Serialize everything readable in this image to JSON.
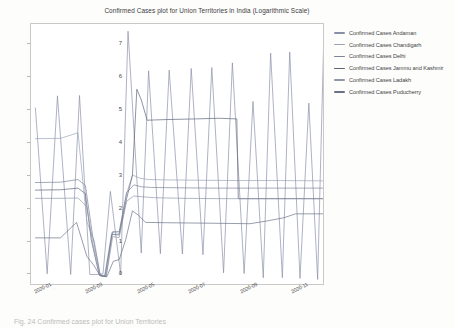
{
  "figure": {
    "caption_partial": "Fig. 24   Confirmed cases plot for Union Territories"
  },
  "chart_data": {
    "type": "line",
    "title": "Confirmed Cases plot for Union Territories in India (Logarithmic Scale)",
    "xlabel": "",
    "ylabel": "",
    "grid": false,
    "legend_position": "right",
    "ylim": [
      -0.35,
      7.6
    ],
    "yticks": [
      0,
      1,
      2,
      3,
      4,
      5,
      6,
      7
    ],
    "ytick_labels": [
      "0",
      "1",
      "2",
      "3",
      "4",
      "5",
      "6",
      "7"
    ],
    "xtick_labels": [
      "2020-01",
      "2020-03",
      "2020-05",
      "2020-07",
      "2020-09",
      "2020-11"
    ],
    "xtick_positions": [
      0.04,
      0.215,
      0.39,
      0.565,
      0.74,
      0.915
    ],
    "x_axis_type": "date",
    "note": "y values are log10 of cumulative confirmed cases; sawtooth drops are plotting artifacts of unsorted dates",
    "series": [
      {
        "name": "Confirmed Cases Andaman",
        "color": "#8a8fa8",
        "points": [
          [
            0.015,
            5.05
          ],
          [
            0.055,
            0.02
          ],
          [
            0.09,
            5.42
          ],
          [
            0.135,
            0.0
          ],
          [
            0.165,
            5.43
          ],
          [
            0.2,
            0.0
          ],
          [
            0.225,
            0.0
          ],
          [
            0.245,
            0.02
          ],
          [
            0.27,
            2.52
          ],
          [
            0.305,
            0.0
          ],
          [
            0.33,
            7.38
          ],
          [
            0.375,
            0.65
          ],
          [
            0.4,
            6.18
          ],
          [
            0.44,
            0.63
          ],
          [
            0.47,
            6.2
          ],
          [
            0.515,
            0.62
          ],
          [
            0.545,
            6.25
          ],
          [
            0.585,
            0.6
          ],
          [
            0.615,
            6.28
          ],
          [
            0.655,
            0.05
          ],
          [
            0.685,
            6.42
          ],
          [
            0.725,
            0.03
          ],
          [
            0.755,
            5.25
          ],
          [
            0.79,
            -0.1
          ],
          [
            0.815,
            6.72
          ],
          [
            0.855,
            -0.1
          ],
          [
            0.88,
            6.75
          ],
          [
            0.915,
            -0.12
          ],
          [
            0.945,
            5.2
          ],
          [
            0.975,
            -0.15
          ],
          [
            0.995,
            6.86
          ]
        ]
      },
      {
        "name": "Confirmed Cases Chandigarh",
        "color": "#9aa3ba",
        "points": [
          [
            0.015,
            4.12
          ],
          [
            0.1,
            4.13
          ],
          [
            0.16,
            4.3
          ],
          [
            0.19,
            1.6
          ],
          [
            0.215,
            1.02
          ],
          [
            0.235,
            0.0
          ],
          [
            0.25,
            -0.05
          ],
          [
            0.275,
            1.28
          ],
          [
            0.3,
            1.25
          ],
          [
            0.325,
            2.45
          ],
          [
            0.345,
            3.02
          ],
          [
            0.37,
            2.92
          ],
          [
            0.4,
            2.88
          ],
          [
            0.46,
            2.87
          ],
          [
            0.56,
            2.86
          ],
          [
            0.7,
            2.85
          ],
          [
            0.85,
            2.85
          ],
          [
            0.995,
            2.84
          ]
        ]
      },
      {
        "name": "Confirmed Cases Delhi",
        "color": "#7d8499",
        "points": [
          [
            0.015,
            2.79
          ],
          [
            0.1,
            2.8
          ],
          [
            0.16,
            2.88
          ],
          [
            0.185,
            2.7
          ],
          [
            0.21,
            1.15
          ],
          [
            0.235,
            0.0
          ],
          [
            0.255,
            -0.06
          ],
          [
            0.278,
            1.3
          ],
          [
            0.3,
            1.3
          ],
          [
            0.325,
            2.48
          ],
          [
            0.35,
            2.72
          ],
          [
            0.375,
            2.66
          ],
          [
            0.41,
            2.64
          ],
          [
            0.5,
            2.63
          ],
          [
            0.62,
            2.62
          ],
          [
            0.76,
            2.62
          ],
          [
            0.88,
            2.62
          ],
          [
            0.995,
            2.62
          ]
        ]
      },
      {
        "name": "Confirmed Cases Jammu and Kashmir",
        "color": "#5d6478",
        "points": [
          [
            0.015,
            2.56
          ],
          [
            0.1,
            2.57
          ],
          [
            0.16,
            2.62
          ],
          [
            0.185,
            2.45
          ],
          [
            0.205,
            1.05
          ],
          [
            0.232,
            -0.02
          ],
          [
            0.252,
            -0.05
          ],
          [
            0.275,
            1.22
          ],
          [
            0.3,
            1.2
          ],
          [
            0.325,
            2.3
          ],
          [
            0.345,
            3.0
          ],
          [
            0.36,
            5.62
          ],
          [
            0.375,
            5.3
          ],
          [
            0.395,
            4.68
          ],
          [
            0.46,
            4.7
          ],
          [
            0.56,
            4.72
          ],
          [
            0.64,
            4.74
          ],
          [
            0.7,
            4.72
          ],
          [
            0.705,
            2.3
          ],
          [
            0.8,
            2.3
          ],
          [
            0.9,
            2.3
          ],
          [
            0.995,
            2.3
          ]
        ]
      },
      {
        "name": "Confirmed Cases Ladakh",
        "color": "#8f96aa",
        "points": [
          [
            0.015,
            2.31
          ],
          [
            0.1,
            2.31
          ],
          [
            0.16,
            2.32
          ],
          [
            0.19,
            2.05
          ],
          [
            0.21,
            0.95
          ],
          [
            0.235,
            -0.03
          ],
          [
            0.256,
            -0.06
          ],
          [
            0.278,
            1.15
          ],
          [
            0.3,
            1.12
          ],
          [
            0.325,
            2.22
          ],
          [
            0.35,
            2.38
          ],
          [
            0.375,
            2.36
          ],
          [
            0.42,
            2.33
          ],
          [
            0.52,
            2.31
          ],
          [
            0.64,
            2.3
          ],
          [
            0.78,
            2.3
          ],
          [
            0.9,
            2.3
          ],
          [
            0.995,
            2.3
          ]
        ]
      },
      {
        "name": "Confirmed Cases Puducherry",
        "color": "#6b7287",
        "points": [
          [
            0.015,
            1.11
          ],
          [
            0.1,
            1.11
          ],
          [
            0.155,
            1.58
          ],
          [
            0.19,
            0.55
          ],
          [
            0.212,
            0.3
          ],
          [
            0.236,
            -0.05
          ],
          [
            0.258,
            -0.07
          ],
          [
            0.28,
            0.4
          ],
          [
            0.3,
            0.45
          ],
          [
            0.322,
            1.05
          ],
          [
            0.345,
            1.93
          ],
          [
            0.365,
            1.8
          ],
          [
            0.39,
            1.58
          ],
          [
            0.46,
            1.57
          ],
          [
            0.56,
            1.56
          ],
          [
            0.66,
            1.55
          ],
          [
            0.745,
            1.54
          ],
          [
            0.8,
            1.62
          ],
          [
            0.86,
            1.72
          ],
          [
            0.9,
            1.84
          ],
          [
            0.995,
            1.84
          ]
        ]
      }
    ]
  }
}
